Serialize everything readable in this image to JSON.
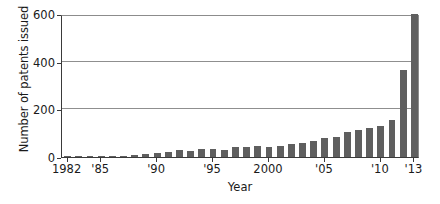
{
  "chart_data": {
    "type": "bar",
    "title": "",
    "xlabel": "Year",
    "ylabel": "Number of patents issued",
    "ylim": [
      0,
      600
    ],
    "yticks": [
      0,
      200,
      400,
      600
    ],
    "ytick_labels": [
      "0",
      "200",
      "400",
      "600"
    ],
    "grid": true,
    "legend": "none",
    "xtick_labels": [
      "1982",
      "'85",
      "'90",
      "'95",
      "2000",
      "'05",
      "'10",
      "'13"
    ],
    "xtick_years": [
      1982,
      1985,
      1990,
      1995,
      2000,
      2005,
      2010,
      2013
    ],
    "categories": [
      "1982",
      "1983",
      "1984",
      "1985",
      "1986",
      "1987",
      "1988",
      "1989",
      "1990",
      "1991",
      "1992",
      "1993",
      "1994",
      "1995",
      "1996",
      "1997",
      "1998",
      "1999",
      "2000",
      "2001",
      "2002",
      "2003",
      "2004",
      "2005",
      "2006",
      "2007",
      "2008",
      "2009",
      "2010",
      "2011",
      "2012",
      "2013"
    ],
    "values": [
      2,
      2,
      3,
      3,
      4,
      5,
      8,
      14,
      18,
      22,
      30,
      26,
      32,
      35,
      30,
      40,
      42,
      45,
      44,
      46,
      55,
      60,
      68,
      80,
      85,
      105,
      115,
      120,
      130,
      155,
      365,
      600
    ],
    "bar_color": "#5f5f5f"
  }
}
